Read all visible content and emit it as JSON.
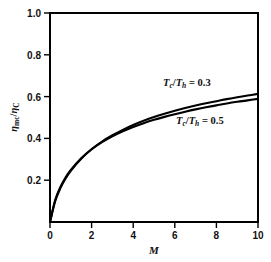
{
  "chart_data": {
    "type": "line",
    "title": "",
    "subtitle": "",
    "xlabel": "M",
    "ylabel": "ηmc/ηC",
    "xlim": [
      0,
      10
    ],
    "ylim": [
      0,
      1.0
    ],
    "xticks": [
      "0",
      "2",
      "4",
      "6",
      "8",
      "10"
    ],
    "xtick_values": [
      0,
      2,
      4,
      6,
      8,
      10
    ],
    "yticks": [
      "0.2",
      "0.4",
      "0.6",
      "0.8",
      "1.0"
    ],
    "ytick_values": [
      0.2,
      0.4,
      0.6,
      0.8,
      1.0
    ],
    "grid": false,
    "legend_position": "inline-annotation",
    "series": [
      {
        "name": "Tc/Th = 0.3",
        "label_main": "T",
        "label_sub1": "c",
        "label_slash": "/T",
        "label_sub2": "h",
        "label_eq": " = 0.3",
        "x": [
          0,
          0.25,
          0.5,
          0.75,
          1,
          1.5,
          2,
          2.5,
          3,
          3.5,
          4,
          4.5,
          5,
          5.5,
          6,
          6.5,
          7,
          7.5,
          8,
          8.5,
          9,
          9.5,
          10
        ],
        "values": [
          0,
          0.105,
          0.168,
          0.213,
          0.249,
          0.305,
          0.348,
          0.382,
          0.41,
          0.434,
          0.455,
          0.473,
          0.489,
          0.503,
          0.516,
          0.528,
          0.539,
          0.549,
          0.558,
          0.567,
          0.575,
          0.582,
          0.589
        ]
      },
      {
        "name": "Tc/Th = 0.5",
        "label_main": "T",
        "label_sub1": "c",
        "label_slash": "/T",
        "label_sub2": "h",
        "label_eq": " = 0.5",
        "x": [
          0,
          0.25,
          0.5,
          0.75,
          1,
          1.5,
          2,
          2.5,
          3,
          3.5,
          4,
          4.5,
          5,
          5.5,
          6,
          6.5,
          7,
          7.5,
          8,
          8.5,
          9,
          9.5,
          10
        ],
        "values": [
          0,
          0.1,
          0.162,
          0.208,
          0.245,
          0.303,
          0.348,
          0.385,
          0.415,
          0.441,
          0.464,
          0.484,
          0.502,
          0.518,
          0.532,
          0.545,
          0.557,
          0.568,
          0.578,
          0.588,
          0.597,
          0.605,
          0.613
        ]
      }
    ],
    "annotations": [
      {
        "text": "Tc/Th = 0.3",
        "x": 6.2,
        "y": 0.665
      },
      {
        "text": "Tc/Th = 0.5",
        "x": 6.9,
        "y": 0.485
      }
    ],
    "colors": {
      "line": "#000000",
      "axis": "#000000",
      "background": "#ffffff"
    }
  }
}
